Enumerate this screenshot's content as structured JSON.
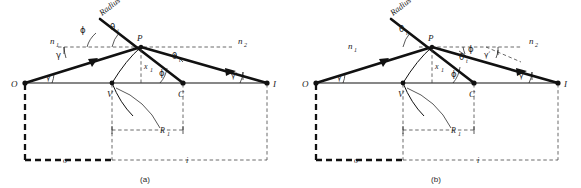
{
  "figure": {
    "kind": "optical-refraction-spherical-surface",
    "panels": [
      {
        "caption": "(a)",
        "points": {
          "O": "O",
          "V": "V",
          "C": "C",
          "I": "I",
          "P": "P"
        },
        "media": {
          "left": "n",
          "left_sub": "1",
          "right": "n",
          "right_sub": "2"
        },
        "radius_label": "Radius",
        "angles": {
          "phi_top": "ϕ",
          "theta_i": "θ",
          "theta_i_sub": "i",
          "theta_t": "θ",
          "theta_t_sub": "t",
          "phi_lower": "ϕ",
          "gamma_upper": "γ",
          "gamma_at_O": "γ",
          "gamma_prime": "γ′"
        },
        "dimensions": {
          "height": "x",
          "height_sub": "1",
          "radius": "R",
          "radius_sub": "1",
          "object_distance": "o",
          "image_distance": "i"
        }
      },
      {
        "caption": "(b)",
        "points": {
          "O": "O",
          "V": "V",
          "C": "C",
          "I": "I",
          "P": "P"
        },
        "media": {
          "left": "n",
          "left_sub": "1",
          "right": "n",
          "right_sub": "2"
        },
        "radius_label": "Radius",
        "angles": {
          "theta_i": "θ",
          "theta_i_sub": "i",
          "theta_t": "θ",
          "theta_t_sub": "t",
          "phi_upper": "ϕ",
          "phi_lower": "ϕ",
          "gamma_at_O": "γ",
          "gamma_prime_upper": "γ′",
          "gamma_prime_lower": "γ′"
        },
        "dimensions": {
          "height": "x",
          "height_sub": "1",
          "radius": "R",
          "radius_sub": "1",
          "object_distance": "o",
          "image_distance": "i"
        }
      }
    ],
    "colors": {
      "ink": "#111111",
      "dash": "#444444",
      "background": "#ffffff"
    }
  }
}
